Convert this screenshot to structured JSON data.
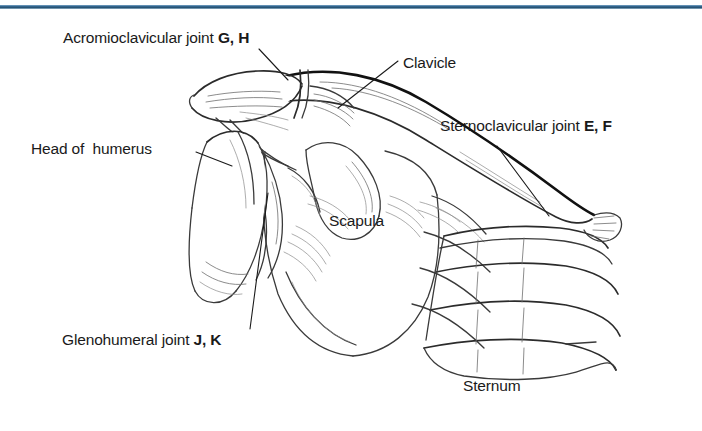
{
  "figure": {
    "background_color": "#ffffff",
    "rule_color": "#2e5f87",
    "ink_color": "#1a1a1a"
  },
  "labels": {
    "acromioclavicular": {
      "text": "Acromioclavicular joint ",
      "code": "G, H"
    },
    "clavicle": {
      "text": "Clavicle",
      "code": ""
    },
    "sternoclavicular": {
      "text": "Sternoclavicular joint ",
      "code": "E, F"
    },
    "head_of_humerus": {
      "text": "Head of  humerus",
      "code": ""
    },
    "scapula": {
      "text": "Scapula",
      "code": ""
    },
    "glenohumeral": {
      "text": "Glenohumeral joint ",
      "code": "J, K"
    },
    "sternum": {
      "text": "Sternum",
      "code": ""
    }
  },
  "structures": [
    {
      "name": "clavicle",
      "kind": "bone"
    },
    {
      "name": "scapula",
      "kind": "bone"
    },
    {
      "name": "acromion",
      "kind": "bone"
    },
    {
      "name": "coracoid-process",
      "kind": "bone"
    },
    {
      "name": "humerus-head",
      "kind": "bone"
    },
    {
      "name": "sternum",
      "kind": "bone"
    },
    {
      "name": "ribs",
      "kind": "bone"
    }
  ]
}
